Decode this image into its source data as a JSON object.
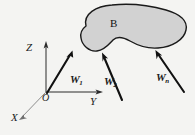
{
  "figure": {
    "type": "free-body-diagram",
    "background_color": "#f4f4f2",
    "body": {
      "label": "B",
      "fill_color": "#d2d2d2",
      "stroke_color": "#1a1a1a",
      "shape": "kidney-blob"
    },
    "axes": {
      "origin_label": "O",
      "z_label": "Z",
      "y_label": "Y",
      "x_label": "X",
      "stroke_color": "#2b2b2b",
      "x_stroke_color": "#8d8d8d"
    },
    "forces": [
      {
        "name": "W1",
        "label": "W",
        "subscript": "1"
      },
      {
        "name": "W2",
        "label": "W",
        "subscript": "2"
      },
      {
        "name": "Wn",
        "label": "W",
        "subscript": "n"
      }
    ],
    "force_stroke_color": "#111111"
  }
}
